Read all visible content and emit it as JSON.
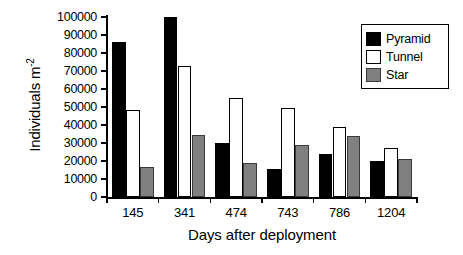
{
  "chart_data": {
    "type": "bar",
    "title": "",
    "xlabel": "Days after deployment",
    "ylabel": "Individuals m-2",
    "ylabel_base": "Individuals m",
    "ylabel_exponent": "-2",
    "categories": [
      "145",
      "341",
      "474",
      "743",
      "786",
      "1204"
    ],
    "series": [
      {
        "name": "Pyramid",
        "color": "#000000",
        "values": [
          86000,
          100000,
          30000,
          15500,
          24000,
          20000
        ]
      },
      {
        "name": "Tunnel",
        "color": "#ffffff",
        "values": [
          48500,
          73000,
          55000,
          49500,
          39000,
          27000
        ]
      },
      {
        "name": "Star",
        "color": "#808080",
        "values": [
          16500,
          34500,
          19000,
          29000,
          34000,
          21000
        ]
      }
    ],
    "ylim": [
      0,
      100000
    ],
    "ytick_values": [
      0,
      10000,
      20000,
      30000,
      40000,
      50000,
      60000,
      70000,
      80000,
      90000,
      100000
    ],
    "ytick_labels": [
      "0",
      "10000",
      "20000",
      "30000",
      "40000",
      "50000",
      "60000",
      "70000",
      "80000",
      "90000",
      "100000"
    ],
    "grid": false,
    "legend_position": "top-right",
    "legend_entries": [
      "Pyramid",
      "Tunnel",
      "Star"
    ]
  }
}
